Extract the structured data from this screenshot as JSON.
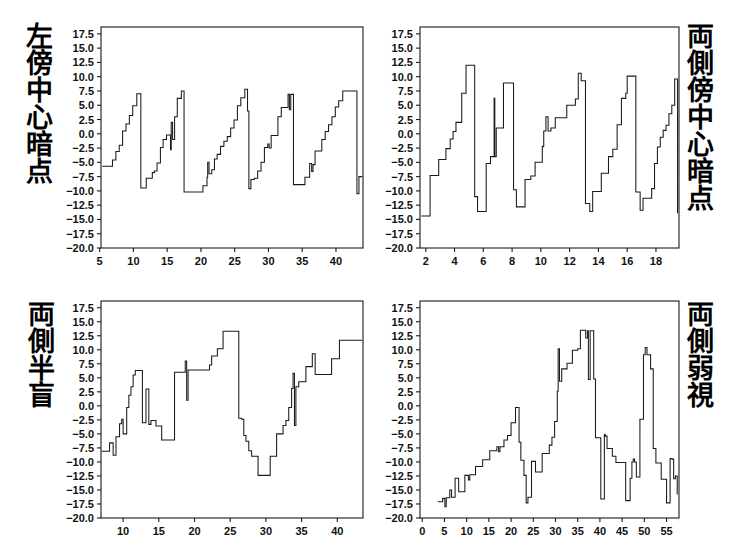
{
  "figure": {
    "layout": "2x2 grid of step-line time-series panels",
    "background_color": "#ffffff",
    "line_color": "#1a1a1a"
  },
  "chart_data": [
    {
      "id": "top-left",
      "type": "line",
      "line_style": "step",
      "title": "左傍中心暗点",
      "label_position": "left",
      "xlabel": "",
      "ylabel": "",
      "xlim": [
        5.2,
        44.0
      ],
      "ylim": [
        -20.0,
        18.7
      ],
      "grid": false,
      "legend": null,
      "xticks": [
        5,
        10,
        15,
        20,
        25,
        30,
        35,
        40
      ],
      "yticks": [
        -20.0,
        -17.5,
        -15.0,
        -12.5,
        -10.0,
        -7.5,
        -5.0,
        -2.5,
        0.0,
        2.5,
        5.0,
        7.5,
        10.0,
        12.5,
        15.0,
        17.5
      ],
      "ytick_labels": [
        "-20.0",
        "-17.5",
        "-15.0",
        "-12.5",
        "-10.0",
        "-7.5",
        "-5.0",
        "-2.5",
        "0.0",
        "2.5",
        "5.0",
        "7.5",
        "10.0",
        "12.5",
        "15.0",
        "17.5"
      ],
      "x": [
        5.4,
        6.6,
        6.9,
        7.4,
        7.9,
        8.4,
        8.9,
        9.4,
        9.9,
        10.5,
        10.9,
        11.1,
        11.9,
        12.6,
        12.8,
        13.1,
        13.5,
        14.0,
        14.4,
        14.9,
        15.3,
        15.5,
        15.6,
        15.8,
        16.1,
        16.5,
        16.9,
        17.1,
        17.3,
        17.5,
        19.9,
        20.3,
        20.6,
        20.9,
        21.0,
        21.2,
        21.6,
        22.0,
        22.4,
        22.9,
        23.4,
        23.9,
        24.4,
        24.9,
        25.4,
        25.9,
        26.3,
        26.5,
        26.7,
        26.9,
        27.1,
        27.4,
        27.9,
        28.4,
        28.9,
        29.4,
        29.7,
        29.9,
        30.1,
        30.4,
        30.9,
        31.4,
        31.9,
        32.4,
        32.9,
        33.1,
        33.3,
        33.5,
        33.7,
        34.9,
        35.4,
        35.9,
        36.1,
        36.4,
        36.6,
        36.9,
        37.4,
        37.9,
        38.4,
        38.9,
        39.4,
        39.9,
        40.4,
        41.0,
        42.8,
        43.1,
        43.4,
        43.9
      ],
      "y": [
        -5.7,
        -5.7,
        -4.6,
        -3.1,
        -2.0,
        0.5,
        1.7,
        3.2,
        4.9,
        7.0,
        7.0,
        -9.5,
        -7.8,
        -7.8,
        -6.8,
        -6.5,
        -5.1,
        -2.4,
        -1.0,
        -0.2,
        -0.2,
        -2.8,
        2.0,
        -1.0,
        3.0,
        6.2,
        6.2,
        7.5,
        7.5,
        -10.2,
        -10.2,
        -9.1,
        -9.1,
        -7.6,
        -5.0,
        -7.0,
        -6.3,
        -4.4,
        -3.6,
        -2.2,
        -1.3,
        -0.5,
        1.0,
        2.4,
        4.9,
        6.3,
        6.3,
        7.8,
        7.8,
        4.0,
        -9.6,
        -8.0,
        -7.8,
        -6.5,
        -5.0,
        -2.4,
        -2.4,
        -1.8,
        -2.5,
        -0.3,
        -0.3,
        3.0,
        4.6,
        4.6,
        6.9,
        4.2,
        6.9,
        6.9,
        -8.9,
        -8.9,
        -7.6,
        -7.6,
        -5.2,
        -6.6,
        -5.4,
        -3.0,
        -3.0,
        -1.0,
        0.4,
        1.6,
        3.0,
        4.7,
        5.8,
        7.5,
        7.5,
        -10.5,
        -7.5,
        -7.5
      ]
    },
    {
      "id": "top-right",
      "type": "line",
      "line_style": "step",
      "title": "両側傍中心暗点",
      "label_position": "right",
      "xlabel": "",
      "ylabel": "",
      "xlim": [
        1.6,
        19.6
      ],
      "ylim": [
        -20.0,
        18.7
      ],
      "grid": false,
      "legend": null,
      "xticks": [
        2,
        4,
        6,
        8,
        10,
        12,
        14,
        16,
        18
      ],
      "yticks": [
        -20.0,
        -17.5,
        -15.0,
        -12.5,
        -10.0,
        -7.5,
        -5.0,
        -2.5,
        0.0,
        2.5,
        5.0,
        7.5,
        10.0,
        12.5,
        15.0,
        17.5
      ],
      "ytick_labels": [
        "-20.0",
        "-17.5",
        "-15.0",
        "-12.5",
        "-10.0",
        "-7.5",
        "-5.0",
        "-2.5",
        "0.0",
        "2.5",
        "5.0",
        "7.5",
        "10.0",
        "12.5",
        "15.0",
        "17.5"
      ],
      "x": [
        1.7,
        2.1,
        2.3,
        2.6,
        2.9,
        3.1,
        3.4,
        3.7,
        3.9,
        4.1,
        4.3,
        4.5,
        4.7,
        4.8,
        5.0,
        5.4,
        5.6,
        5.9,
        6.2,
        6.5,
        6.7,
        6.75,
        6.8,
        6.9,
        7.0,
        7.4,
        7.8,
        8.1,
        8.3,
        8.5,
        8.9,
        9.3,
        9.6,
        9.9,
        10.1,
        10.2,
        10.35,
        10.5,
        10.7,
        11.0,
        11.4,
        11.8,
        12.1,
        12.4,
        12.6,
        12.8,
        13.1,
        13.4,
        13.6,
        13.9,
        14.2,
        14.4,
        14.7,
        15.0,
        15.3,
        15.6,
        15.9,
        16.0,
        16.2,
        16.6,
        16.9,
        17.1,
        17.4,
        17.7,
        17.9,
        18.1,
        18.3,
        18.5,
        18.7,
        18.9,
        19.1,
        19.3,
        19.5
      ],
      "y": [
        -14.4,
        -14.4,
        -7.3,
        -7.3,
        -4.5,
        -4.5,
        -2.6,
        -0.9,
        0.4,
        2.0,
        2.0,
        7.1,
        7.1,
        12.0,
        12.0,
        -11.0,
        -13.6,
        -13.6,
        -5.2,
        -4.0,
        -4.0,
        6.2,
        -4.0,
        1.0,
        1.0,
        8.9,
        8.9,
        -9.8,
        -12.8,
        -12.8,
        -8.0,
        -7.4,
        -5.0,
        -5.0,
        -2.2,
        0.5,
        3.0,
        0.5,
        1.0,
        2.8,
        2.8,
        5.0,
        5.0,
        6.1,
        10.6,
        9.3,
        -12.2,
        -13.6,
        -10.1,
        -10.1,
        -6.9,
        -6.9,
        -4.0,
        -2.7,
        1.6,
        6.2,
        7.1,
        10.1,
        10.1,
        -10.2,
        -13.4,
        -11.3,
        -11.3,
        -9.6,
        -5.2,
        -2.3,
        -0.6,
        0.6,
        1.5,
        3.5,
        5.0,
        9.6,
        -13.9
      ]
    },
    {
      "id": "bottom-left",
      "type": "line",
      "line_style": "step",
      "title": "両側半盲",
      "label_position": "left",
      "xlabel": "",
      "ylabel": "",
      "xlim": [
        6.9,
        43.6
      ],
      "ylim": [
        -20.0,
        18.7
      ],
      "grid": false,
      "legend": null,
      "xticks": [
        10,
        15,
        20,
        25,
        30,
        35,
        40
      ],
      "yticks": [
        -20.0,
        -17.5,
        -15.0,
        -12.5,
        -10.0,
        -7.5,
        -5.0,
        -2.5,
        0.0,
        2.5,
        5.0,
        7.5,
        10.0,
        12.5,
        15.0,
        17.5
      ],
      "ytick_labels": [
        "-20.0",
        "-17.5",
        "-15.0",
        "-12.5",
        "-10.0",
        "-7.5",
        "-5.0",
        "-2.5",
        "0.0",
        "2.5",
        "5.0",
        "7.5",
        "10.0",
        "12.5",
        "15.0",
        "17.5"
      ],
      "x": [
        7.0,
        7.9,
        8.1,
        8.4,
        8.6,
        8.8,
        9.0,
        9.2,
        9.5,
        9.8,
        10.0,
        10.2,
        10.5,
        10.8,
        11.1,
        11.4,
        11.7,
        12.0,
        12.3,
        12.7,
        13.0,
        13.2,
        13.4,
        13.6,
        13.9,
        14.2,
        14.6,
        15.0,
        15.4,
        17.0,
        17.2,
        18.5,
        18.7,
        18.9,
        19.1,
        21.8,
        22.1,
        22.4,
        22.8,
        23.2,
        23.6,
        24.0,
        24.4,
        25.8,
        26.2,
        26.6,
        26.9,
        27.2,
        27.6,
        28.0,
        28.4,
        28.9,
        29.2,
        30.6,
        31.0,
        31.5,
        32.0,
        32.4,
        32.8,
        33.2,
        33.6,
        33.8,
        34.0,
        34.2,
        34.6,
        35.0,
        35.6,
        36.0,
        36.5,
        36.9,
        37.4,
        39.2,
        39.8,
        40.3,
        43.5
      ],
      "y": [
        -8.1,
        -8.1,
        -6.6,
        -6.6,
        -8.8,
        -8.8,
        -5.5,
        -5.5,
        -3.2,
        -2.4,
        -5.0,
        -5.0,
        -0.3,
        1.9,
        3.4,
        5.5,
        6.3,
        6.3,
        6.3,
        -3.0,
        -3.0,
        3.0,
        3.0,
        -3.3,
        -2.6,
        -2.6,
        -3.6,
        -3.6,
        -6.1,
        -6.1,
        6.0,
        6.0,
        8.0,
        1.0,
        6.4,
        6.4,
        7.3,
        8.9,
        8.9,
        10.2,
        10.2,
        13.3,
        13.3,
        13.3,
        -2.2,
        -2.4,
        -5.3,
        -6.3,
        -8.0,
        -9.0,
        -9.0,
        -12.4,
        -12.4,
        -9.0,
        -9.0,
        -5.0,
        -5.0,
        -3.5,
        -2.6,
        -0.3,
        3.1,
        5.8,
        -3.5,
        3.4,
        4.3,
        4.3,
        7.0,
        7.0,
        9.3,
        5.6,
        5.6,
        8.4,
        8.4,
        11.7,
        11.7
      ]
    },
    {
      "id": "bottom-right",
      "type": "line",
      "line_style": "step",
      "title": "両側弱視",
      "label_position": "right",
      "xlabel": "",
      "ylabel": "",
      "xlim": [
        -0.5,
        57.8
      ],
      "ylim": [
        -20.0,
        18.7
      ],
      "grid": false,
      "legend": null,
      "xticks": [
        0,
        5,
        10,
        15,
        20,
        25,
        30,
        35,
        40,
        45,
        50,
        55
      ],
      "yticks": [
        -20.0,
        -17.5,
        -15.0,
        -12.5,
        -10.0,
        -7.5,
        -5.0,
        -2.5,
        0.0,
        2.5,
        5.0,
        7.5,
        10.0,
        12.5,
        15.0,
        17.5
      ],
      "ytick_labels": [
        "-20.0",
        "-17.5",
        "-15.0",
        "-12.5",
        "-10.0",
        "-7.5",
        "-5.0",
        "-2.5",
        "0.0",
        "2.5",
        "5.0",
        "7.5",
        "10.0",
        "12.5",
        "15.0",
        "17.5"
      ],
      "x": [
        3.5,
        4.3,
        4.6,
        4.9,
        5.1,
        5.4,
        5.8,
        6.2,
        6.6,
        7.0,
        7.4,
        7.8,
        8.2,
        8.6,
        9.2,
        9.6,
        10.0,
        10.4,
        10.7,
        10.9,
        11.3,
        12.0,
        12.8,
        13.6,
        14.4,
        15.2,
        16.0,
        16.8,
        17.2,
        17.5,
        17.8,
        18.4,
        19.2,
        20.0,
        20.6,
        21.0,
        21.4,
        21.8,
        22.2,
        22.6,
        22.9,
        23.1,
        23.4,
        23.8,
        24.2,
        24.6,
        25.0,
        25.5,
        26.2,
        27.0,
        27.8,
        28.6,
        29.2,
        29.8,
        30.2,
        30.4,
        30.6,
        30.9,
        31.4,
        32.0,
        32.6,
        33.2,
        33.8,
        34.4,
        35.0,
        35.6,
        36.2,
        36.8,
        37.2,
        37.4,
        37.8,
        38.2,
        38.6,
        39.0,
        39.6,
        40.2,
        40.6,
        41.0,
        41.2,
        41.6,
        42.2,
        42.8,
        43.6,
        44.4,
        45.2,
        45.8,
        46.2,
        46.8,
        47.2,
        47.5,
        47.8,
        48.2,
        48.6,
        49.0,
        49.4,
        49.8,
        50.2,
        50.6,
        51.0,
        51.4,
        52.0,
        52.6,
        53.2,
        53.8,
        54.4,
        55.0,
        55.4,
        55.8,
        56.2,
        56.6,
        57.0,
        57.4
      ],
      "y": [
        -17.1,
        -17.1,
        -16.5,
        -16.5,
        -18.0,
        -16.4,
        -16.4,
        -15.0,
        -16.3,
        -16.3,
        -12.9,
        -12.9,
        -15.3,
        -15.3,
        -15.3,
        -12.4,
        -12.4,
        -13.2,
        -12.3,
        -12.3,
        -12.3,
        -10.8,
        -10.8,
        -9.6,
        -9.6,
        -8.0,
        -8.0,
        -7.3,
        -8.2,
        -7.3,
        -7.3,
        -6.1,
        -5.3,
        -3.0,
        -3.0,
        -0.3,
        -0.3,
        -6.5,
        -9.7,
        -9.7,
        -12.4,
        -12.4,
        -17.3,
        -16.3,
        -16.3,
        -9.9,
        -9.9,
        -11.8,
        -11.8,
        -8.5,
        -8.5,
        -7.0,
        -5.6,
        -2.8,
        -2.8,
        2.6,
        10.2,
        4.4,
        6.6,
        6.6,
        7.6,
        7.6,
        9.9,
        9.9,
        10.2,
        13.5,
        13.5,
        12.1,
        13.4,
        4.7,
        13.4,
        13.4,
        4.8,
        -5.7,
        -5.7,
        -16.6,
        -16.6,
        -5.1,
        -5.4,
        -7.6,
        -7.6,
        -9.0,
        -10.1,
        -10.1,
        -10.1,
        -16.9,
        -16.9,
        -12.9,
        -10.0,
        -9.5,
        -10.0,
        -12.7,
        -12.7,
        -2.4,
        -2.4,
        9.1,
        10.4,
        9.1,
        9.1,
        6.6,
        -7.6,
        -10.2,
        -10.2,
        -13.1,
        -13.1,
        -17.3,
        -17.3,
        -9.4,
        -9.5,
        -13.0,
        -12.5,
        -15.8,
        -14.4
      ]
    }
  ]
}
